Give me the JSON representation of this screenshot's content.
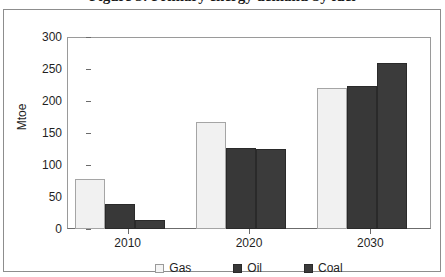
{
  "figure": {
    "clipped_title": "Figure 3: Primary energy demand by fuel",
    "y_axis_title": "Mtoe"
  },
  "chart_data": {
    "type": "bar",
    "title": "",
    "xlabel": "",
    "ylabel": "Mtoe",
    "ylim": [
      0,
      300
    ],
    "yticks": [
      0,
      50,
      100,
      150,
      200,
      250,
      300
    ],
    "ytick_labels": [
      "0",
      "50",
      "100",
      "150",
      "200",
      "250",
      "300"
    ],
    "grid": false,
    "legend_position": "bottom",
    "categories": [
      "2010",
      "2020",
      "2030"
    ],
    "series": [
      {
        "name": "Gas",
        "color": "#f1f1f1",
        "values": [
          78,
          167,
          221
        ]
      },
      {
        "name": "Oil",
        "color": "#383838",
        "values": [
          39,
          126,
          223
        ]
      },
      {
        "name": "Coal",
        "color": "#3b3b3b",
        "values": [
          14,
          125,
          260
        ]
      }
    ]
  },
  "legend": {
    "items": [
      {
        "label": "Gas",
        "swatch": "legend-swatch-gas"
      },
      {
        "label": "Oil",
        "swatch": "legend-swatch-oil"
      },
      {
        "label": "Coal",
        "swatch": "legend-swatch-coal"
      }
    ]
  }
}
